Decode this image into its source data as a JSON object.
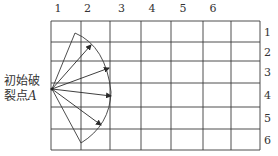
{
  "diagram": {
    "column_labels": [
      "1",
      "2",
      "3",
      "4",
      "5",
      "6"
    ],
    "row_labels": [
      "1",
      "2",
      "3",
      "4",
      "5",
      "6"
    ],
    "point_label_line1": "初始破",
    "point_label_line2": "裂点",
    "point_label_symbol": "A",
    "grid": {
      "x_lines": [
        51,
        81,
        110,
        141,
        171,
        203,
        231,
        260
      ],
      "y_lines": [
        21,
        42,
        61,
        83,
        107,
        129,
        150
      ]
    },
    "origin": [
      52,
      89
    ],
    "sector_ends": [
      [
        75,
        33
      ],
      [
        81,
        143
      ]
    ],
    "arrow_tips": [
      [
        91,
        45
      ],
      [
        109,
        68
      ],
      [
        111,
        96
      ],
      [
        101,
        125
      ]
    ],
    "line_color": "#3a3a3a"
  }
}
